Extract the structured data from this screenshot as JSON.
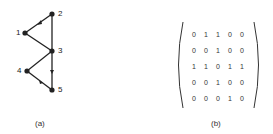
{
  "graph": {
    "caption": "(a)",
    "nodes": [
      {
        "id": "1",
        "label": "1",
        "x": 25,
        "y": 33
      },
      {
        "id": "2",
        "label": "2",
        "x": 52,
        "y": 14
      },
      {
        "id": "3",
        "label": "3",
        "x": 52,
        "y": 51
      },
      {
        "id": "4",
        "label": "4",
        "x": 27,
        "y": 71
      },
      {
        "id": "5",
        "label": "5",
        "x": 52,
        "y": 90
      }
    ],
    "edges": [
      {
        "from": "1",
        "to": "2"
      },
      {
        "from": "1",
        "to": "3"
      },
      {
        "from": "2",
        "to": "3"
      },
      {
        "from": "3",
        "to": "4"
      },
      {
        "from": "3",
        "to": "5"
      },
      {
        "from": "4",
        "to": "5"
      }
    ]
  },
  "matrix": {
    "caption": "(b)",
    "rows": [
      [
        "0",
        "1",
        "1",
        "0",
        "0"
      ],
      [
        "0",
        "0",
        "1",
        "0",
        "0"
      ],
      [
        "1",
        "1",
        "0",
        "1",
        "1"
      ],
      [
        "0",
        "0",
        "1",
        "0",
        "0"
      ],
      [
        "0",
        "0",
        "0",
        "1",
        "0"
      ]
    ]
  }
}
